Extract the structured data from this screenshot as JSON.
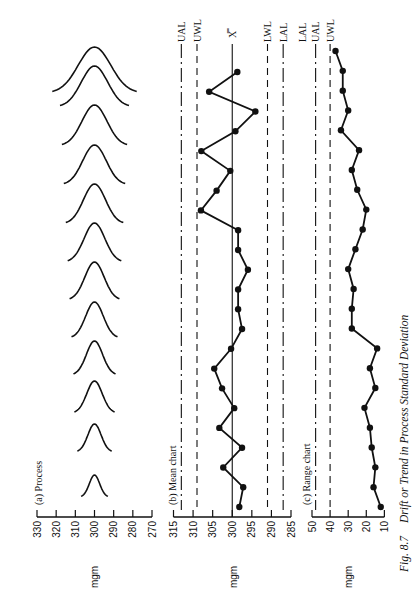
{
  "caption": {
    "fig_number": "Fig. 8.7",
    "title": "Drift or Trend in Process Standard Deviation"
  },
  "colors": {
    "ink": "#111111",
    "background": "#ffffff"
  },
  "chart_data": [
    {
      "id": "process",
      "type": "line",
      "title": "(a) Process",
      "ylabel": "mgm",
      "axis_ticks": [
        330,
        320,
        310,
        300,
        290,
        280,
        270
      ],
      "axis_range": [
        330,
        270
      ],
      "description": "Sequence of normal distribution curves centered at 300 mgm with steadily increasing spread (standard deviation drifting upward over time).",
      "series": [
        {
          "name": "curve",
          "sample": 1,
          "mean": 300,
          "half_width": 7,
          "height_px": 22
        },
        {
          "name": "curve",
          "sample": 2,
          "mean": 300,
          "half_width": 9,
          "height_px": 28
        },
        {
          "name": "curve",
          "sample": 3,
          "mean": 300,
          "half_width": 10.5,
          "height_px": 32
        },
        {
          "name": "curve",
          "sample": 4,
          "mean": 300,
          "half_width": 11,
          "height_px": 34
        },
        {
          "name": "curve",
          "sample": 5,
          "mean": 300,
          "half_width": 12,
          "height_px": 36
        },
        {
          "name": "curve",
          "sample": 6,
          "mean": 300,
          "half_width": 13,
          "height_px": 38
        },
        {
          "name": "curve",
          "sample": 7,
          "mean": 300,
          "half_width": 14,
          "height_px": 39
        },
        {
          "name": "curve",
          "sample": 8,
          "mean": 300,
          "half_width": 15,
          "height_px": 40
        },
        {
          "name": "curve",
          "sample": 9,
          "mean": 300,
          "half_width": 16,
          "height_px": 40
        },
        {
          "name": "curve",
          "sample": 10,
          "mean": 300,
          "half_width": 17,
          "height_px": 41
        },
        {
          "name": "curve",
          "sample": 11,
          "mean": 300,
          "half_width": 18,
          "height_px": 41
        },
        {
          "name": "curve",
          "sample": 12,
          "mean": 300,
          "half_width": 22,
          "height_px": 46
        }
      ]
    },
    {
      "id": "mean",
      "type": "line",
      "title": "(b) Mean chart",
      "ylabel": "mgm",
      "axis_ticks": [
        315,
        310,
        305,
        300,
        295,
        290,
        285
      ],
      "axis_range": [
        315,
        285
      ],
      "center_line": {
        "label": "X̿",
        "value": 300
      },
      "control_lines": [
        {
          "label": "UAL",
          "value": 313,
          "style": "dash-dot"
        },
        {
          "label": "UWL",
          "value": 309,
          "style": "dashed"
        },
        {
          "label": "LWL",
          "value": 291,
          "style": "dashed"
        },
        {
          "label": "LAL",
          "value": 287,
          "style": "dash-dot"
        }
      ],
      "values": [
        298.2,
        297.2,
        302.3,
        297.5,
        303.3,
        299.5,
        302.6,
        304.6,
        300.3,
        297.5,
        298.5,
        298.5,
        296.0,
        298.5,
        298.5,
        308.0,
        304.0,
        300.5,
        307.9,
        299.2,
        294.1,
        305.9,
        298.7
      ]
    },
    {
      "id": "range",
      "type": "line",
      "title": "(c) Range chart",
      "ylabel": "mgm",
      "axis_ticks": [
        50,
        40,
        30,
        20,
        10
      ],
      "axis_range": [
        50,
        8
      ],
      "control_lines": [
        {
          "label": "UAL",
          "value": 48,
          "style": "dash-dot"
        },
        {
          "label": "UWL",
          "value": 40,
          "style": "dashed"
        }
      ],
      "extra_labels": [
        {
          "label": "LAL",
          "value": 55
        }
      ],
      "values": [
        12,
        16,
        15,
        17,
        18,
        21,
        15,
        18,
        14,
        28,
        28,
        27,
        30,
        26,
        22,
        20,
        25,
        28,
        24,
        34,
        30,
        33,
        33,
        37
      ]
    }
  ]
}
